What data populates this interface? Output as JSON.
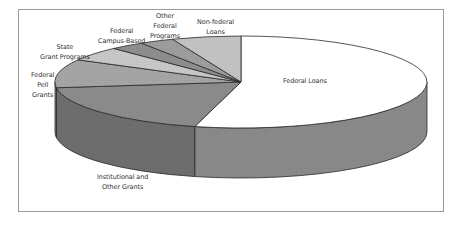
{
  "chart_data": {
    "type": "pie",
    "style": "3d-pie",
    "title": "",
    "categories": [
      "Federal Loans",
      "Institutional and Other Grants",
      "Federal Pell Grants",
      "State Grant Programs",
      "Federal Campus-Based",
      "Other Federal Programs",
      "Non-federal Loans"
    ],
    "values": [
      54,
      19,
      10,
      5,
      3,
      3,
      6
    ],
    "unit": "percent (estimated)",
    "colors": [
      "#ffffff",
      "#8c8c8c",
      "#a6a6a6",
      "#c9c9c9",
      "#8f8f8f",
      "#9e9e9e",
      "#c4c4c4"
    ],
    "legend": "none (data labels)",
    "labels": [
      {
        "text": "Federal Loans",
        "lines": [
          "Federal Loans"
        ]
      },
      {
        "text": "Institutional and Other Grants",
        "lines": [
          "Institutional and",
          "Other Grants"
        ]
      },
      {
        "text": "Federal Pell Grants",
        "lines": [
          "Federal",
          "Pell",
          "Grants"
        ]
      },
      {
        "text": "State Grant Programs",
        "lines": [
          "State",
          "Grant Programs"
        ]
      },
      {
        "text": "Federal Campus-Based",
        "lines": [
          "Federal",
          "Campus-Based"
        ]
      },
      {
        "text": "Other Federal Programs",
        "lines": [
          "Other",
          "Federal",
          "Programs"
        ]
      },
      {
        "text": "Non-federal Loans",
        "lines": [
          "Non-federal",
          "Loans"
        ]
      }
    ]
  },
  "labels": {
    "federal_loans": "Federal Loans",
    "institutional": "Institutional and\nOther Grants",
    "pell": "Federal\nPell\nGrants",
    "state": "State\nGrant Programs",
    "campus": "Federal\nCampus-Based",
    "other_federal": "Other\nFederal\nPrograms",
    "nonfederal": "Non-federal\nLoans"
  }
}
